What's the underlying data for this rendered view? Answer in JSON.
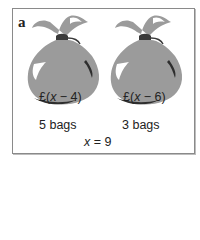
{
  "panel_label": "a",
  "bags": [
    {
      "expression": "£(x − 4)",
      "expr_prefix": "£(",
      "expr_var": "x",
      "expr_rest": " − 4)",
      "count_label": "5 bags"
    },
    {
      "expression": "£(x − 6)",
      "expr_prefix": "£(",
      "expr_var": "x",
      "expr_rest": " − 6)",
      "count_label": "3 bags"
    }
  ],
  "equation": {
    "var": "x",
    "rest": " = 9"
  },
  "colors": {
    "bag_fill": "#9b9b9b",
    "bag_shadow": "#2e2e2e",
    "highlight": "#ffffff",
    "tie": "#3a3a3a",
    "border": "#8a8a8a"
  }
}
